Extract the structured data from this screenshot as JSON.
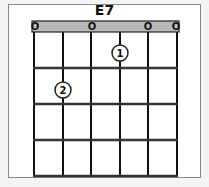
{
  "chord": {
    "name": "E7",
    "strings": 6,
    "frets_shown": 4,
    "open_strings": [
      1,
      3,
      5,
      6
    ],
    "open_marker": "O",
    "fingers": [
      {
        "finger": "1",
        "string": 4,
        "fret": 1
      },
      {
        "finger": "2",
        "string": 2,
        "fret": 2
      }
    ]
  },
  "colors": {
    "nut_fill": "#b9b9b9",
    "line": "#111111",
    "frame_border": "#8a8a8a",
    "background": "#ffffff"
  }
}
